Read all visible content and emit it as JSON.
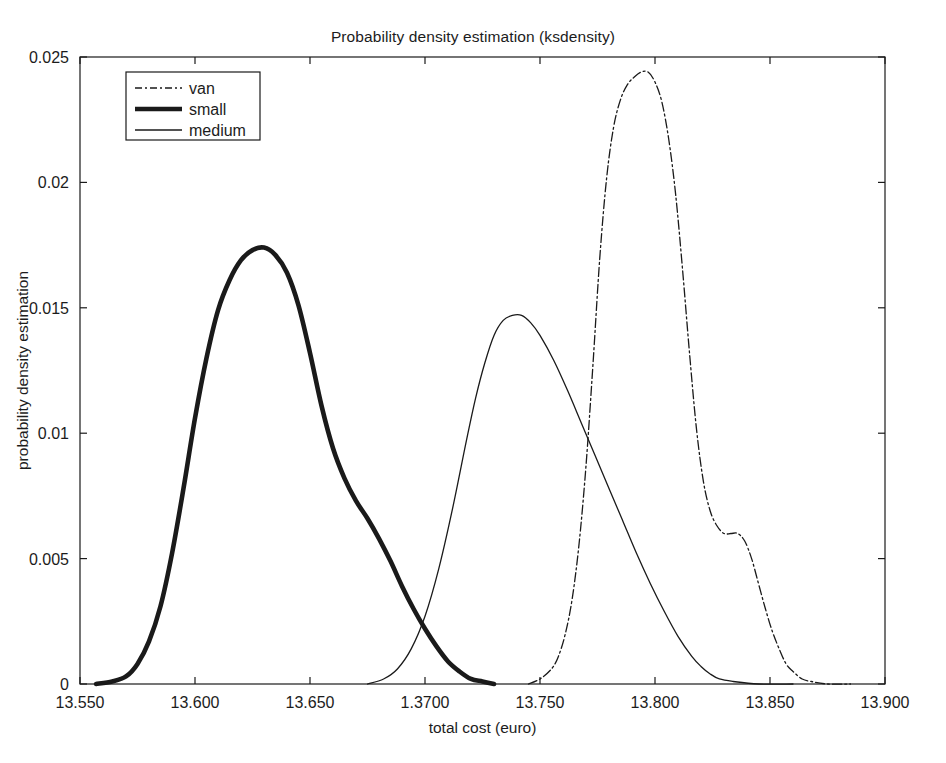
{
  "chart_data": {
    "type": "line",
    "title": "Probability density estimation (ksdensity)",
    "xlabel": "total cost (euro)",
    "ylabel": "probability density estimation",
    "xlim": [
      13.55,
      13.9
    ],
    "ylim": [
      0,
      0.025
    ],
    "grid": false,
    "legend_position": "top-left",
    "xticks": [
      13.55,
      13.6,
      13.65,
      13.7,
      13.75,
      13.8,
      13.85,
      13.9
    ],
    "xtick_labels": [
      "13.550",
      "13.600",
      "13.650",
      "1.3700",
      "13.750",
      "13.800",
      "13.850",
      "13.900"
    ],
    "yticks": [
      0,
      0.005,
      0.01,
      0.015,
      0.02,
      0.025
    ],
    "ytick_labels": [
      "0",
      "0.005",
      "0.01",
      "0.015",
      "0.02",
      "0.025"
    ],
    "series": [
      {
        "name": "van",
        "style": "dash-dot",
        "linewidth": 1.3,
        "color": "#1a1a1a",
        "peak_x": 13.797,
        "peak_y": 0.0244,
        "points": [
          [
            13.745,
            0.0
          ],
          [
            13.75,
            0.0002
          ],
          [
            13.755,
            0.0006
          ],
          [
            13.758,
            0.0011
          ],
          [
            13.761,
            0.002
          ],
          [
            13.764,
            0.0034
          ],
          [
            13.767,
            0.0056
          ],
          [
            13.77,
            0.0087
          ],
          [
            13.773,
            0.0127
          ],
          [
            13.776,
            0.017
          ],
          [
            13.779,
            0.0202
          ],
          [
            13.782,
            0.0222
          ],
          [
            13.785,
            0.0233
          ],
          [
            13.788,
            0.0239
          ],
          [
            13.791,
            0.0242
          ],
          [
            13.794,
            0.0244
          ],
          [
            13.797,
            0.0244
          ],
          [
            13.8,
            0.024
          ],
          [
            13.803,
            0.0232
          ],
          [
            13.806,
            0.0217
          ],
          [
            13.809,
            0.0195
          ],
          [
            13.812,
            0.0165
          ],
          [
            13.815,
            0.0132
          ],
          [
            13.818,
            0.0102
          ],
          [
            13.821,
            0.0081
          ],
          [
            13.824,
            0.0069
          ],
          [
            13.827,
            0.0063
          ],
          [
            13.83,
            0.006
          ],
          [
            13.833,
            0.006
          ],
          [
            13.836,
            0.006
          ],
          [
            13.839,
            0.0057
          ],
          [
            13.842,
            0.005
          ],
          [
            13.845,
            0.004
          ],
          [
            13.848,
            0.003
          ],
          [
            13.851,
            0.0021
          ],
          [
            13.854,
            0.0014
          ],
          [
            13.857,
            0.0008
          ],
          [
            13.86,
            0.0005
          ],
          [
            13.864,
            0.0002
          ],
          [
            13.868,
            0.0001
          ],
          [
            13.875,
            0.0
          ],
          [
            13.885,
            0.0
          ]
        ]
      },
      {
        "name": "small",
        "style": "solid",
        "linewidth": 4.6,
        "color": "#1a1a1a",
        "peak_x": 13.63,
        "peak_y": 0.0174,
        "points": [
          [
            13.557,
            0.0
          ],
          [
            13.564,
            0.0001
          ],
          [
            13.57,
            0.0003
          ],
          [
            13.575,
            0.0008
          ],
          [
            13.58,
            0.0017
          ],
          [
            13.585,
            0.0031
          ],
          [
            13.59,
            0.0052
          ],
          [
            13.595,
            0.0078
          ],
          [
            13.6,
            0.0106
          ],
          [
            13.605,
            0.013
          ],
          [
            13.61,
            0.0149
          ],
          [
            13.615,
            0.0161
          ],
          [
            13.62,
            0.0169
          ],
          [
            13.625,
            0.0173
          ],
          [
            13.63,
            0.0174
          ],
          [
            13.635,
            0.0171
          ],
          [
            13.64,
            0.0164
          ],
          [
            13.645,
            0.0151
          ],
          [
            13.65,
            0.0132
          ],
          [
            13.655,
            0.0111
          ],
          [
            13.66,
            0.0094
          ],
          [
            13.665,
            0.0082
          ],
          [
            13.67,
            0.0073
          ],
          [
            13.675,
            0.0066
          ],
          [
            13.68,
            0.0058
          ],
          [
            13.685,
            0.0049
          ],
          [
            13.69,
            0.0039
          ],
          [
            13.695,
            0.003
          ],
          [
            13.7,
            0.0022
          ],
          [
            13.705,
            0.0015
          ],
          [
            13.71,
            0.0009
          ],
          [
            13.715,
            0.0005
          ],
          [
            13.72,
            0.0002
          ],
          [
            13.725,
            0.0001
          ],
          [
            13.73,
            0.0
          ]
        ]
      },
      {
        "name": "medium",
        "style": "solid",
        "linewidth": 1.3,
        "color": "#1a1a1a",
        "peak_x": 13.74,
        "peak_y": 0.0147,
        "points": [
          [
            13.675,
            0.0
          ],
          [
            13.682,
            0.0002
          ],
          [
            13.688,
            0.0006
          ],
          [
            13.694,
            0.0014
          ],
          [
            13.7,
            0.0027
          ],
          [
            13.706,
            0.0046
          ],
          [
            13.712,
            0.007
          ],
          [
            13.718,
            0.0097
          ],
          [
            13.722,
            0.0114
          ],
          [
            13.726,
            0.0128
          ],
          [
            13.73,
            0.0139
          ],
          [
            13.734,
            0.0145
          ],
          [
            13.738,
            0.0147
          ],
          [
            13.742,
            0.0147
          ],
          [
            13.746,
            0.0144
          ],
          [
            13.75,
            0.0139
          ],
          [
            13.756,
            0.0129
          ],
          [
            13.762,
            0.0117
          ],
          [
            13.768,
            0.0104
          ],
          [
            13.774,
            0.0091
          ],
          [
            13.78,
            0.0078
          ],
          [
            13.786,
            0.0065
          ],
          [
            13.792,
            0.0052
          ],
          [
            13.798,
            0.004
          ],
          [
            13.804,
            0.0029
          ],
          [
            13.81,
            0.0019
          ],
          [
            13.816,
            0.0011
          ],
          [
            13.82,
            0.0007
          ],
          [
            13.824,
            0.0004
          ],
          [
            13.828,
            0.0002
          ],
          [
            13.834,
            0.0001
          ],
          [
            13.845,
            0.0
          ],
          [
            13.86,
            0.0
          ]
        ]
      }
    ]
  }
}
